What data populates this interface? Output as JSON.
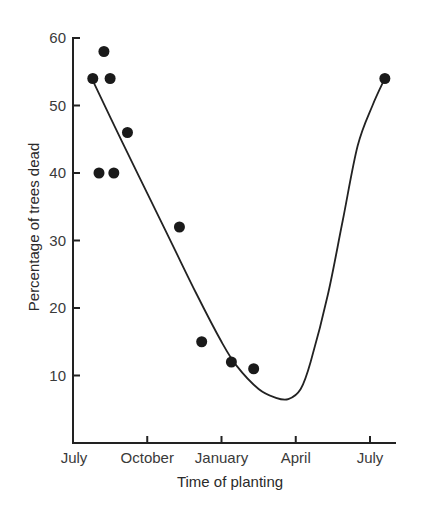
{
  "chart_data": {
    "type": "scatter",
    "title": "",
    "xlabel": "Time of planting",
    "ylabel": "Percentage of trees dead",
    "x_unit": "months since July",
    "xlim": [
      0,
      13
    ],
    "ylim": [
      0,
      60
    ],
    "x_ticks": [
      {
        "value": 0,
        "label": "July"
      },
      {
        "value": 3,
        "label": "October"
      },
      {
        "value": 6,
        "label": "January"
      },
      {
        "value": 9,
        "label": "April"
      },
      {
        "value": 12,
        "label": "July"
      }
    ],
    "y_ticks": [
      10,
      20,
      30,
      40,
      50,
      60
    ],
    "grid": false,
    "legend": null,
    "series": [
      {
        "name": "Observed mortality",
        "kind": "points",
        "points": [
          {
            "x": 0.8,
            "y": 54
          },
          {
            "x": 1.05,
            "y": 40
          },
          {
            "x": 1.25,
            "y": 58
          },
          {
            "x": 1.5,
            "y": 54
          },
          {
            "x": 1.65,
            "y": 40
          },
          {
            "x": 2.2,
            "y": 46
          },
          {
            "x": 4.3,
            "y": 32
          },
          {
            "x": 5.2,
            "y": 15
          },
          {
            "x": 6.4,
            "y": 12
          },
          {
            "x": 7.3,
            "y": 11
          },
          {
            "x": 12.6,
            "y": 54
          }
        ]
      },
      {
        "name": "Fitted curve",
        "kind": "line",
        "points": [
          {
            "x": 0.85,
            "y": 53.3
          },
          {
            "x": 2.0,
            "y": 44.5
          },
          {
            "x": 3.0,
            "y": 37
          },
          {
            "x": 4.0,
            "y": 29.5
          },
          {
            "x": 5.0,
            "y": 22
          },
          {
            "x": 6.0,
            "y": 15
          },
          {
            "x": 6.6,
            "y": 11.5
          },
          {
            "x": 7.5,
            "y": 8
          },
          {
            "x": 8.2,
            "y": 6.7
          },
          {
            "x": 8.7,
            "y": 6.5
          },
          {
            "x": 9.2,
            "y": 8
          },
          {
            "x": 9.6,
            "y": 12
          },
          {
            "x": 10.3,
            "y": 22
          },
          {
            "x": 10.9,
            "y": 33
          },
          {
            "x": 11.5,
            "y": 44
          },
          {
            "x": 12.1,
            "y": 50
          },
          {
            "x": 12.6,
            "y": 54
          }
        ]
      }
    ]
  }
}
